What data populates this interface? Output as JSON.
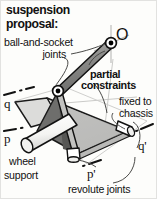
{
  "figure": {
    "title_line1": "suspension",
    "title_line2": "proposal:",
    "background_color": "#fdfdfb",
    "ink_color": "#111111"
  },
  "labels": {
    "ball_socket_line1": "ball-and-socket",
    "ball_socket_line2": "joints",
    "partial_line1": "partial",
    "partial_line2": "constraints",
    "fixed_line1": "fixed to",
    "fixed_line2": "chassis",
    "wheel_line1": "wheel",
    "wheel_line2": "support",
    "revolute": "revolute joints",
    "point_O": "O",
    "axis_q": "q",
    "axis_p": "p",
    "axis_q_prime": "q'",
    "axis_p_prime": "p'"
  },
  "geometry": {
    "plate_fill": "#d9d9d7",
    "plate_edge": "#1a1a1a",
    "wedge_fill": "#777775",
    "wedge_dark_fill": "#5e5e5c",
    "rod_fill": "#9a9a98",
    "cylinder_fill": "#ffffff",
    "joint_marker_fill": "#000000",
    "axis_line_color": "#1a1a1a",
    "leader_color": "#4a4a48",
    "crosshair_color": "#b8b8b6"
  },
  "joints": {
    "upper_ball_socket": {
      "x": 110,
      "y": 42,
      "type": "ball-and-socket"
    },
    "lower_ball_socket": {
      "x": 57,
      "y": 90,
      "type": "ball-and-socket"
    },
    "right_revolute": {
      "x": 127,
      "y": 130,
      "type": "revolute"
    },
    "bottom_revolute": {
      "x": 72,
      "y": 155,
      "type": "revolute"
    }
  }
}
